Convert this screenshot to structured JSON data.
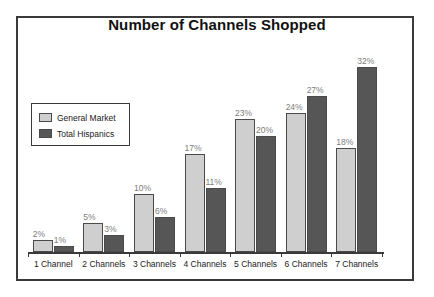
{
  "chart_data": {
    "type": "bar",
    "title": "Number of Channels Shopped",
    "xlabel": "",
    "ylabel": "",
    "ylim": [
      0,
      36
    ],
    "grid": false,
    "legend_position": "upper-left-inside",
    "categories": [
      "1 Channel",
      "2 Channels",
      "3 Channels",
      "4 Channels",
      "5 Channels",
      "6 Channels",
      "7 Channels"
    ],
    "series": [
      {
        "name": "General Market",
        "color": "#cfcfcf",
        "values": [
          2,
          5,
          10,
          17,
          23,
          24,
          18
        ],
        "labels": [
          "2%",
          "5%",
          "10%",
          "17%",
          "23%",
          "24%",
          "18%"
        ]
      },
      {
        "name": "Total Hispanics",
        "color": "#565656",
        "values": [
          1,
          3,
          6,
          11,
          20,
          27,
          32
        ],
        "labels": [
          "1%",
          "3%",
          "6%",
          "11%",
          "20%",
          "27%",
          "32%"
        ]
      }
    ]
  }
}
